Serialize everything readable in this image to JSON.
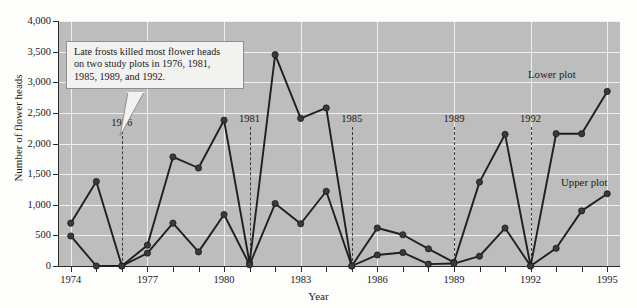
{
  "chart_data": {
    "type": "line",
    "title": "",
    "xlabel": "Year",
    "ylabel": "Number of flower heads",
    "xlim": [
      1973.5,
      1995.5
    ],
    "ylim": [
      0,
      4000
    ],
    "grid": true,
    "legend_position": "inline-right",
    "x": [
      1974,
      1975,
      1976,
      1977,
      1978,
      1979,
      1980,
      1981,
      1982,
      1983,
      1984,
      1985,
      1986,
      1987,
      1988,
      1989,
      1990,
      1991,
      1992,
      1993,
      1994,
      1995
    ],
    "xticklabels": [
      "1974",
      "1977",
      "1980",
      "1983",
      "1986",
      "1989",
      "1992",
      "1995"
    ],
    "xticklabel_years": [
      1974,
      1977,
      1980,
      1983,
      1986,
      1989,
      1992,
      1995
    ],
    "yticks": [
      0,
      500,
      1000,
      1500,
      2000,
      2500,
      3000,
      3500,
      4000
    ],
    "yticklabels": [
      "0",
      "500",
      "1,000",
      "1,500",
      "2,000",
      "2,500",
      "3,000",
      "3,500",
      "4,000"
    ],
    "series": [
      {
        "name": "Lower plot",
        "values": [
          700,
          1380,
          0,
          340,
          1780,
          1600,
          2380,
          50,
          3450,
          2410,
          2580,
          0,
          620,
          510,
          280,
          60,
          1370,
          2150,
          0,
          2160,
          2160,
          2850
        ]
      },
      {
        "name": "Upper plot",
        "values": [
          490,
          0,
          0,
          210,
          700,
          230,
          840,
          20,
          1020,
          690,
          1220,
          0,
          180,
          220,
          30,
          40,
          160,
          620,
          0,
          290,
          900,
          1180
        ]
      }
    ],
    "annotations": [
      {
        "name": "frost-1976",
        "year": 1976,
        "label": "1976"
      },
      {
        "name": "frost-1981",
        "year": 1981,
        "label": "1981"
      },
      {
        "name": "frost-1985",
        "year": 1985,
        "label": "1985"
      },
      {
        "name": "frost-1989",
        "year": 1989,
        "label": "1989"
      },
      {
        "name": "frost-1992",
        "year": 1992,
        "label": "1992"
      }
    ],
    "callout": {
      "line1": "Late frosts killed most flower heads",
      "line2": "on two study plots in 1976, 1981,",
      "line3": "1985, 1989, and 1992."
    },
    "series_labels": {
      "lower": "Lower plot",
      "upper": "Upper plot"
    },
    "colors": {
      "plot_background": "#bdbdbd",
      "gridline": "#f0f0f0",
      "line": "#1f1f1f",
      "marker": "#3a3a3a",
      "axis": "#2b2b2b",
      "callout_background": "#f2f2f0",
      "page_background": "#fdfdfc"
    }
  }
}
